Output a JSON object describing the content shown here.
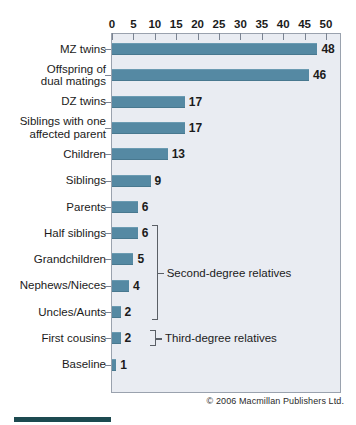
{
  "chart_data": {
    "type": "bar",
    "orientation": "horizontal",
    "title": "",
    "subtitle": "",
    "xlabel": "",
    "ylabel": "",
    "xlim": [
      0,
      50
    ],
    "xticks": [
      0,
      5,
      10,
      15,
      20,
      25,
      30,
      35,
      40,
      45,
      50
    ],
    "xtick_labels": [
      "0",
      "5",
      "10",
      "15",
      "20",
      "25",
      "30",
      "35",
      "40",
      "45",
      "50"
    ],
    "grid": false,
    "legend": "none",
    "categories": [
      "MZ twins",
      "Offspring of\ndual matings",
      "DZ twins",
      "Siblings with one\naffected parent",
      "Children",
      "Siblings",
      "Parents",
      "Half siblings",
      "Grandchildren",
      "Nephews/Nieces",
      "Uncles/Aunts",
      "First cousins",
      "Baseline"
    ],
    "values": [
      48,
      46,
      17,
      17,
      13,
      9,
      6,
      6,
      5,
      4,
      2,
      2,
      1
    ],
    "value_labels": [
      "48",
      "46",
      "17",
      "17",
      "13",
      "9",
      "6",
      "6",
      "5",
      "4",
      "2",
      "2",
      "1"
    ],
    "bar_color": "#5589a3",
    "plot_background": "#e9ecf2",
    "annotations": [
      {
        "text": "Second-degree relatives",
        "covers": [
          "Half siblings",
          "Grandchildren",
          "Nephews/Nieces",
          "Uncles/Aunts"
        ]
      },
      {
        "text": "Third-degree relatives",
        "covers": [
          "First cousins"
        ]
      }
    ]
  },
  "credit": "© 2006 Macmillan Publishers Ltd.",
  "accent_color": "#1d4a50"
}
